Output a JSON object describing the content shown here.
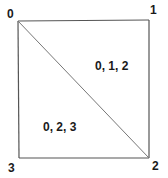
{
  "diagram": {
    "type": "triangulated-square",
    "colors": {
      "stroke": "#555555",
      "text": "#1a1a1a",
      "background": "#ffffff"
    },
    "vertices": [
      {
        "id": "0",
        "label": "0",
        "position": "top-left"
      },
      {
        "id": "1",
        "label": "1",
        "position": "top-right"
      },
      {
        "id": "2",
        "label": "2",
        "position": "bottom-right"
      },
      {
        "id": "3",
        "label": "3",
        "position": "bottom-left"
      }
    ],
    "edges": [
      [
        "0",
        "1"
      ],
      [
        "1",
        "2"
      ],
      [
        "2",
        "3"
      ],
      [
        "3",
        "0"
      ],
      [
        "0",
        "2"
      ]
    ],
    "triangles": [
      {
        "label": "0, 1, 2",
        "vertices": [
          "0",
          "1",
          "2"
        ]
      },
      {
        "label": "0, 2, 3",
        "vertices": [
          "0",
          "2",
          "3"
        ]
      }
    ]
  }
}
